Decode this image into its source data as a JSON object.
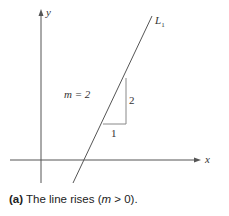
{
  "figure": {
    "axes": {
      "x_label": "x",
      "y_label": "y"
    },
    "line": {
      "label": "L",
      "label_subscript": "1"
    },
    "slope_annotation": "m = 2",
    "triangle": {
      "run_label": "1",
      "rise_label": "2"
    },
    "colors": {
      "axis": "#555555",
      "line": "#555555",
      "triangle": "#888888",
      "text": "#333333"
    }
  },
  "caption": {
    "tag": "(a)",
    "text_before": " The line rises (",
    "math": "m",
    "text_after": " > 0)."
  }
}
